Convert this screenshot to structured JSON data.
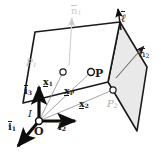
{
  "figure": {
    "type": "geometry-diagram",
    "background_color": "#ffffff",
    "ink_color": "#1a1a1a",
    "plane2_fill": "#e9e9e9",
    "plane1_fill": "#ffffff",
    "faint_color": "#c9c9c9"
  },
  "labels": {
    "normal1": {
      "base": "n",
      "sub": "1",
      "overbar": true,
      "color": "#c9c9c9"
    },
    "normal2": {
      "base": "n",
      "sub": "2",
      "overbar": true,
      "color": "#1a1a1a"
    },
    "line_dir": {
      "base": "ℓ",
      "sub": "",
      "overbar": true,
      "color": "#1a1a1a"
    },
    "plane1": {
      "base": "P",
      "sub": "1",
      "color": "#b9b9b9"
    },
    "plane2": {
      "base": "P",
      "sub": "2",
      "color": "#adadad"
    },
    "point_P": {
      "base": "P",
      "sub": "",
      "color": "#1a1a1a"
    },
    "vec_x1": {
      "base": "x",
      "sub": "1",
      "underline": true
    },
    "vec_x2": {
      "base": "x",
      "sub": "2",
      "underline": true
    },
    "vec_xP": {
      "base": "x",
      "sub": "P",
      "underline": true
    },
    "axis_i1": {
      "base": "i",
      "sub": "1",
      "overbar": true
    },
    "axis_i2": {
      "base": "i",
      "sub": "2",
      "overbar": true
    },
    "axis_i3": {
      "base": "i",
      "sub": "3",
      "overbar": true
    },
    "frame": {
      "base": "I",
      "sub": "",
      "color": "#1a1a1a"
    },
    "origin": {
      "base": "O",
      "sub": "",
      "color": "#1a1a1a"
    }
  },
  "geometry": {
    "plane1_polygon": "23,103 35,32 120,22 108,82",
    "plane2_polygon": "108,82 120,22 147,67 137,131",
    "point_on_plane1": {
      "cx": 63,
      "cy": 72,
      "r": 3.1
    },
    "point_on_plane2": {
      "cx": 113,
      "cy": 90,
      "r": 3.1
    },
    "point_P": {
      "cx": 91,
      "cy": 72,
      "r": 3.3
    },
    "origin_point": {
      "cx": 39,
      "cy": 121,
      "r": 3.3
    },
    "normal1_arrow": {
      "x1": 69,
      "y1": 64,
      "x2": 72,
      "y2": 16
    },
    "normal2_arrow": {
      "x1": 118,
      "y1": 76,
      "x2": 145,
      "y2": 45
    },
    "line_arrow": {
      "x1": 120,
      "y1": 28,
      "x2": 118,
      "y2": 10
    },
    "axis_i3_arrow": {
      "x1": 39,
      "y1": 121,
      "x2": 39,
      "y2": 83
    },
    "axis_i2_arrow": {
      "x1": 39,
      "y1": 121,
      "x2": 79,
      "y2": 121
    },
    "axis_i1_arrow": {
      "x1": 39,
      "y1": 121,
      "x2": 15,
      "y2": 150
    },
    "ray_to_x1": {
      "x1": 39,
      "y1": 121,
      "x2": 63,
      "y2": 72
    },
    "ray_to_xP": {
      "x1": 39,
      "y1": 121,
      "x2": 91,
      "y2": 72
    },
    "ray_to_x2": {
      "x1": 39,
      "y1": 121,
      "x2": 113,
      "y2": 90
    }
  },
  "label_positions": {
    "normal1": {
      "left": 71,
      "top": 8
    },
    "normal2": {
      "left": 140,
      "top": 50
    },
    "line_dir": {
      "left": 122,
      "top": 15
    },
    "plane1": {
      "left": 27,
      "top": 60
    },
    "plane2": {
      "left": 108,
      "top": 101
    },
    "point_P": {
      "left": 94,
      "top": 70
    },
    "vec_x1": {
      "left": 44,
      "top": 79
    },
    "vec_xP": {
      "left": 65,
      "top": 88
    },
    "vec_x2": {
      "left": 80,
      "top": 100
    },
    "axis_i1": {
      "left": 9,
      "top": 124
    },
    "axis_i2": {
      "left": 59,
      "top": 124
    },
    "axis_i3": {
      "left": 25,
      "top": 87
    },
    "frame": {
      "left": 29,
      "top": 110
    },
    "origin": {
      "left": 35,
      "top": 127
    }
  }
}
